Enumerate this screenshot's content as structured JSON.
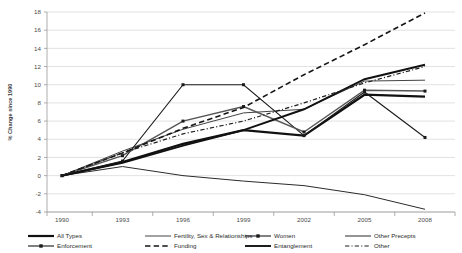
{
  "chart_data": {
    "type": "line",
    "title": "",
    "xlabel": "",
    "ylabel": "% Change since 1990",
    "x": [
      1990,
      1993,
      1996,
      1999,
      2002,
      2005,
      2008
    ],
    "xtick_labels": [
      "1990",
      "1993",
      "1996",
      "1999",
      "2002",
      "2005",
      "2008"
    ],
    "ytick_labels": [
      "-4",
      "-2",
      "0",
      "2",
      "4",
      "6",
      "8",
      "10",
      "12",
      "14",
      "16",
      "18"
    ],
    "ylim": [
      -4,
      18
    ],
    "xlim": [
      1990,
      2008
    ],
    "grid": true,
    "legend_position": "bottom",
    "series": [
      {
        "name": "All Types",
        "values": [
          0,
          1.5,
          3.5,
          5.0,
          4.4,
          8.9,
          8.7
        ],
        "style": "solid",
        "width": 2.2,
        "markers": false,
        "color": "#111111"
      },
      {
        "name": "Fertility, Sex & Relationships",
        "values": [
          0,
          2.7,
          5.1,
          6.9,
          7.3,
          10.4,
          10.5
        ],
        "style": "solid",
        "width": 1.0,
        "markers": false,
        "color": "#444444"
      },
      {
        "name": "Women",
        "values": [
          0,
          1.6,
          10.0,
          10.0,
          4.4,
          9.2,
          4.2
        ],
        "style": "solid",
        "width": 1.1,
        "markers": true,
        "color": "#1a1a1a"
      },
      {
        "name": "Other Precepts",
        "values": [
          0,
          1.0,
          0.0,
          -0.6,
          -1.1,
          -2.1,
          -3.7
        ],
        "style": "solid",
        "width": 1.0,
        "markers": false,
        "color": "#2b2b2b"
      },
      {
        "name": "Enforcement",
        "values": [
          0,
          2.2,
          6.0,
          7.6,
          4.8,
          9.4,
          9.3
        ],
        "style": "solid",
        "width": 1.5,
        "markers": true,
        "color": "#555555"
      },
      {
        "name": "Funding",
        "values": [
          0,
          2.5,
          5.2,
          7.5,
          11.1,
          14.4,
          17.9
        ],
        "style": "dashed",
        "width": 1.6,
        "markers": false,
        "color": "#161616"
      },
      {
        "name": "Entanglement",
        "values": [
          0,
          1.4,
          3.3,
          5.0,
          7.3,
          10.6,
          12.2
        ],
        "style": "solid",
        "width": 1.9,
        "markers": false,
        "color": "#111111"
      },
      {
        "name": "Other",
        "values": [
          0,
          2.5,
          4.6,
          6.0,
          8.0,
          10.2,
          12.0
        ],
        "style": "dashdot",
        "width": 1.2,
        "markers": false,
        "color": "#1f1f1f"
      }
    ]
  },
  "legend": {
    "row1": [
      {
        "label": "All Types",
        "key": "all-types"
      },
      {
        "label": "Fertility, Sex & Relationships",
        "key": "fertility-sex-relationships"
      },
      {
        "label": "Women",
        "key": "women"
      },
      {
        "label": "Other Precepts",
        "key": "other-precepts"
      }
    ],
    "row2": [
      {
        "label": "Enforcement",
        "key": "enforcement"
      },
      {
        "label": "Funding",
        "key": "funding"
      },
      {
        "label": "Entanglement",
        "key": "entanglement"
      },
      {
        "label": "Other",
        "key": "other"
      }
    ]
  },
  "axes": {
    "y_axis_title": "% Change since 1990"
  },
  "colors": {
    "gridline": "#d6d6d6",
    "axis": "#9a9a9a",
    "text": "#3a3a3a",
    "plot_background": "#ffffff"
  }
}
